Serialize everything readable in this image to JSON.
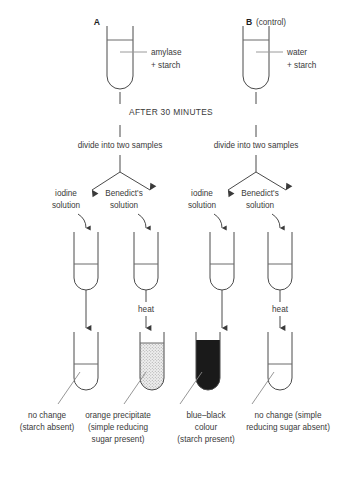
{
  "colors": {
    "ink": "#3a3a3a",
    "glass": "#4a4a4a",
    "black_fill": "#1a1a1a",
    "stipple_fill": "#d8d8d8",
    "leader": "#8a8a8a",
    "background": "#ffffff"
  },
  "top_tubes": [
    {
      "label": "A",
      "sublabel": "",
      "contents_line1": "amylase",
      "contents_line2": "+ starch"
    },
    {
      "label": "B",
      "sublabel": "(control)",
      "contents_line1": "water",
      "contents_line2": "+ starch"
    }
  ],
  "stage_header": "AFTER 30 MINUTES",
  "divide_labels": [
    "divide into two samples",
    "divide into two samples"
  ],
  "reagents": [
    {
      "line1": "iodine",
      "line2": "solution"
    },
    {
      "line1": "Benedict's",
      "line2": "solution"
    },
    {
      "line1": "iodine",
      "line2": "solution"
    },
    {
      "line1": "Benedict's",
      "line2": "solution"
    }
  ],
  "heat_labels": [
    {
      "text": "",
      "show": false
    },
    {
      "text": "heat",
      "show": true
    },
    {
      "text": "",
      "show": false
    },
    {
      "text": "heat",
      "show": true
    }
  ],
  "result_tubes": [
    {
      "fill": "none"
    },
    {
      "fill": "stipple"
    },
    {
      "fill": "solid-black"
    },
    {
      "fill": "none"
    }
  ],
  "results": [
    {
      "lines": [
        "no change",
        "(starch absent)"
      ]
    },
    {
      "lines": [
        "orange precipitate",
        "(simple reducing",
        "sugar present)"
      ]
    },
    {
      "lines": [
        "blue–black",
        "colour",
        "(starch present)"
      ]
    },
    {
      "lines": [
        "no change (simple",
        "reducing sugar absent)"
      ]
    }
  ]
}
